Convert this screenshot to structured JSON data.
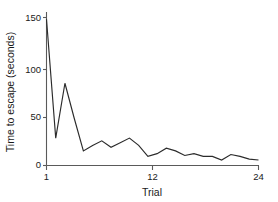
{
  "chart_data": {
    "type": "line",
    "title": "",
    "xlabel": "Trial",
    "ylabel": "Time to escape (seconds)",
    "x": [
      1,
      2,
      3,
      4,
      5,
      6,
      7,
      8,
      9,
      10,
      11,
      12,
      13,
      14,
      15,
      16,
      17,
      18,
      19,
      20,
      21,
      22,
      23,
      24
    ],
    "values": [
      160,
      30,
      90,
      52,
      16,
      22,
      27,
      20,
      25,
      30,
      22,
      10,
      13,
      19,
      16,
      11,
      13,
      10,
      10,
      6,
      12,
      10,
      7,
      6
    ],
    "series": [
      {
        "name": "Time to escape",
        "values": [
          160,
          30,
          90,
          52,
          16,
          22,
          27,
          20,
          25,
          30,
          22,
          10,
          13,
          19,
          16,
          11,
          13,
          10,
          10,
          6,
          12,
          10,
          7,
          6
        ]
      }
    ],
    "xlim": [
      1,
      24
    ],
    "ylim": [
      0,
      168
    ],
    "xticks": [
      1,
      12,
      24
    ],
    "xtick_labels": [
      "1",
      "12",
      "24"
    ],
    "yticks": [
      0,
      50,
      100,
      150
    ],
    "ytick_labels": [
      "0",
      "50",
      "100",
      "150"
    ],
    "grid": false,
    "legend": false,
    "legend_position": "none",
    "line_color": "#2b2b2b",
    "axis_color": "#5a5a5a",
    "background_color": "#ffffff"
  }
}
